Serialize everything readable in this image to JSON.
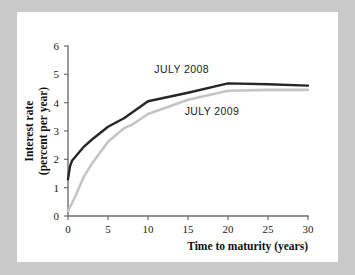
{
  "chart_data": {
    "type": "line",
    "title": "",
    "xlabel": "Time to maturity (years)",
    "ylabel": "Interest rate\n(percent per year)",
    "ylabel_line1": "Interest rate",
    "ylabel_line2": "(percent per year)",
    "xlim": [
      0,
      30
    ],
    "ylim": [
      0,
      6
    ],
    "xticks": [
      0,
      5,
      10,
      15,
      20,
      25,
      30
    ],
    "yticks": [
      0,
      1,
      2,
      3,
      4,
      5,
      6
    ],
    "xtick_labels": [
      "0",
      "5",
      "10",
      "15",
      "20",
      "25",
      "30"
    ],
    "ytick_labels": [
      "0",
      "1",
      "2",
      "3",
      "4",
      "5",
      "6"
    ],
    "grid": false,
    "legend": "inline-annotations",
    "series": [
      {
        "name": "JULY 2008",
        "color": "#262626",
        "label_x": 14.2,
        "label_y": 5.05,
        "x": [
          0,
          0.25,
          0.5,
          1,
          2,
          3,
          5,
          7,
          10,
          15,
          20,
          25,
          30
        ],
        "values": [
          1.3,
          1.75,
          1.95,
          2.12,
          2.45,
          2.7,
          3.15,
          3.45,
          4.05,
          4.35,
          4.68,
          4.65,
          4.6
        ]
      },
      {
        "name": "JULY 2009",
        "color": "#c4c4c4",
        "label_x": 18.0,
        "label_y": 3.55,
        "x": [
          0,
          0.5,
          1,
          2,
          3,
          5,
          7,
          8,
          10,
          15,
          20,
          25,
          30
        ],
        "values": [
          0.18,
          0.45,
          0.75,
          1.4,
          1.85,
          2.62,
          3.1,
          3.22,
          3.6,
          4.1,
          4.42,
          4.45,
          4.45
        ]
      }
    ]
  },
  "chart": {
    "xlabel": "Time to maturity (years)",
    "ylabel_line1": "Interest rate",
    "ylabel_line2": "(percent per year)",
    "series_0_label": "JULY 2008",
    "series_1_label": "JULY 2009",
    "xtick_0": "0",
    "xtick_1": "5",
    "xtick_2": "10",
    "xtick_3": "15",
    "xtick_4": "20",
    "xtick_5": "25",
    "xtick_6": "30",
    "ytick_0": "0",
    "ytick_1": "1",
    "ytick_2": "2",
    "ytick_3": "3",
    "ytick_4": "4",
    "ytick_5": "5",
    "ytick_6": "6"
  },
  "colors": {
    "page_background": "#c9c9c9",
    "card_background": "#ffffff",
    "axis": "#6e6e6e",
    "series_2008": "#262626",
    "series_2009": "#c4c4c4",
    "text": "#1c1c1c"
  }
}
